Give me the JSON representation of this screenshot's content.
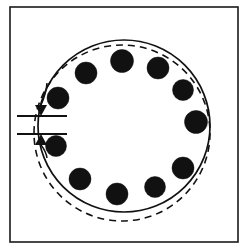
{
  "figure": {
    "kind": "engineering-line-drawing",
    "background_color": "#ffffff",
    "ink_color": "#111111",
    "canvas": {
      "width": 249,
      "height": 251
    }
  },
  "frame": {
    "name": "figure-border",
    "x": 10,
    "y": 7,
    "width": 228,
    "height": 235,
    "stroke": "#1a1a1a",
    "stroke_width": 1.6,
    "fill": "none"
  },
  "solid_circle": {
    "label": "solid-reference-circle",
    "cx": 124,
    "cy": 126,
    "r": 86,
    "stroke": "#111111",
    "stroke_width": 1.7,
    "dash": "none",
    "fill": "none"
  },
  "dashed_circle": {
    "label": "dashed-offset-circle",
    "cx": 122,
    "cy": 133,
    "r": 88,
    "stroke": "#111111",
    "stroke_width": 1.6,
    "dash": "7 5",
    "fill": "none"
  },
  "dots": {
    "label": "bolt-hole-circle",
    "count": 11,
    "fill": "#111111",
    "stroke": "#111111",
    "items": [
      {
        "name": "dot-1",
        "cx": 122,
        "cy": 61,
        "r": 11.5
      },
      {
        "name": "dot-2",
        "cx": 158,
        "cy": 68,
        "r": 11.0
      },
      {
        "name": "dot-3",
        "cx": 183,
        "cy": 90,
        "r": 10.5
      },
      {
        "name": "dot-4",
        "cx": 196,
        "cy": 122,
        "r": 11.5
      },
      {
        "name": "dot-5",
        "cx": 183,
        "cy": 168,
        "r": 11.0
      },
      {
        "name": "dot-6",
        "cx": 155,
        "cy": 187,
        "r": 10.5
      },
      {
        "name": "dot-7",
        "cx": 117,
        "cy": 194,
        "r": 11.0
      },
      {
        "name": "dot-8",
        "cx": 80,
        "cy": 179,
        "r": 11.0
      },
      {
        "name": "dot-9",
        "cx": 56,
        "cy": 146,
        "r": 10.5
      },
      {
        "name": "dot-10",
        "cx": 58,
        "cy": 98,
        "r": 11.0
      },
      {
        "name": "dot-11",
        "cx": 86,
        "cy": 73,
        "r": 11.0
      }
    ]
  },
  "dimension": {
    "label": "offset-gap-dimension",
    "stroke": "#111111",
    "stroke_width": 1.8,
    "upper_extension_line": {
      "x1": 17,
      "y1": 116,
      "x2": 67,
      "y2": 116
    },
    "lower_extension_line": {
      "x1": 17,
      "y1": 134,
      "x2": 67,
      "y2": 134
    },
    "upper_arrow": {
      "tip_x": 41,
      "tip_y": 116,
      "direction": "down",
      "half_width": 6,
      "length": 11
    },
    "lower_arrow": {
      "tip_x": 41,
      "tip_y": 134,
      "direction": "up",
      "half_width": 6,
      "length": 11
    },
    "upper_leader": {
      "x1": 47,
      "y1": 83,
      "x2": 41,
      "y2": 105
    },
    "lower_leader": {
      "x1": 47,
      "y1": 158,
      "x2": 41,
      "y2": 145
    },
    "value_text": ""
  }
}
